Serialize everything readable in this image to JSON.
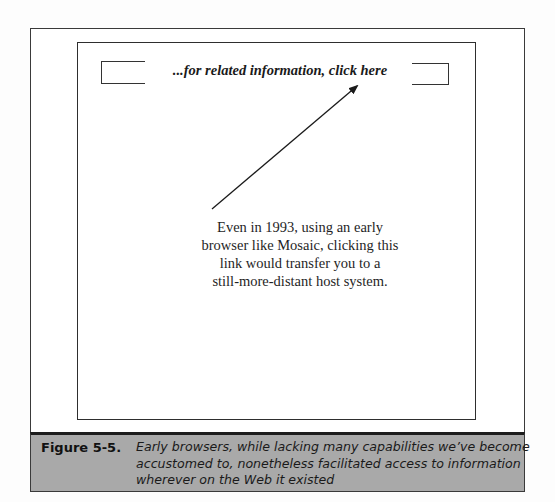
{
  "diagram": {
    "link_text": "...for related information, click here",
    "annotation_lines": [
      "Even in 1993, using an early",
      "browser like Mosaic, clicking this",
      "link would transfer you to a",
      "still-more-distant host system."
    ],
    "arrow": {
      "from": [
        212,
        209
      ],
      "to": [
        358,
        85
      ],
      "color": "#1a1a1a"
    }
  },
  "caption": {
    "label": "Figure 5-5.",
    "text_lines": [
      "Early browsers, while lacking many capabilities we’ve become",
      "accustomed to, nonetheless facilitated access to information",
      "wherever on the Web it existed"
    ],
    "background_color": "#a9a9a9"
  }
}
